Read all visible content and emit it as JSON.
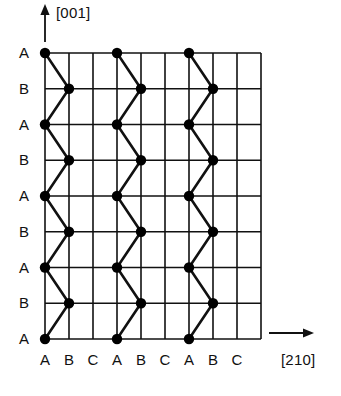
{
  "figure": {
    "type": "crystal-lattice-stacking-diagram",
    "background_color": "#ffffff",
    "line_color": "#111111",
    "node_color": "#000000",
    "axes": {
      "vertical": {
        "label": "[001]",
        "direction": "up",
        "arrow": "arrow-up-icon"
      },
      "horizontal": {
        "label": "[210]",
        "direction": "right",
        "arrow": "arrow-right-icon"
      }
    },
    "grid": {
      "x0": 45,
      "y0": 53,
      "cell_w": 24,
      "cell_h": 35.75,
      "cols": 9,
      "rows": 8,
      "x1": 261,
      "y1": 339,
      "stroke_width": 1.6
    },
    "row_labels": [
      "A",
      "B",
      "A",
      "B",
      "A",
      "B",
      "A",
      "B",
      "A"
    ],
    "col_labels": [
      "A",
      "B",
      "C",
      "A",
      "B",
      "C",
      "A",
      "B",
      "C"
    ],
    "nodes": [
      {
        "col": 0,
        "row": 0
      },
      {
        "col": 3,
        "row": 0
      },
      {
        "col": 6,
        "row": 0
      },
      {
        "col": 1,
        "row": 1
      },
      {
        "col": 4,
        "row": 1
      },
      {
        "col": 7,
        "row": 1
      },
      {
        "col": 0,
        "row": 2
      },
      {
        "col": 3,
        "row": 2
      },
      {
        "col": 6,
        "row": 2
      },
      {
        "col": 1,
        "row": 3
      },
      {
        "col": 4,
        "row": 3
      },
      {
        "col": 7,
        "row": 3
      },
      {
        "col": 0,
        "row": 4
      },
      {
        "col": 3,
        "row": 4
      },
      {
        "col": 6,
        "row": 4
      },
      {
        "col": 1,
        "row": 5
      },
      {
        "col": 4,
        "row": 5
      },
      {
        "col": 7,
        "row": 5
      },
      {
        "col": 0,
        "row": 6
      },
      {
        "col": 3,
        "row": 6
      },
      {
        "col": 6,
        "row": 6
      },
      {
        "col": 1,
        "row": 7
      },
      {
        "col": 4,
        "row": 7
      },
      {
        "col": 7,
        "row": 7
      },
      {
        "col": 0,
        "row": 8
      },
      {
        "col": 3,
        "row": 8
      },
      {
        "col": 6,
        "row": 8
      }
    ],
    "node_radius": 5.2,
    "chains": [
      {
        "name": "zigzag-chain-1",
        "start_col": 0,
        "alt_col": 1
      },
      {
        "name": "zigzag-chain-2",
        "start_col": 3,
        "alt_col": 4
      },
      {
        "name": "zigzag-chain-3",
        "start_col": 6,
        "alt_col": 7
      }
    ],
    "chain_stroke_width": 2.6
  },
  "chart_data": {
    "type": "scatter",
    "title": "",
    "xlabel": "[210]",
    "ylabel": "[001]",
    "x": [
      0,
      1,
      2,
      3,
      4,
      5,
      6,
      7,
      8
    ],
    "xticklabels": [
      "A",
      "B",
      "C",
      "A",
      "B",
      "C",
      "A",
      "B",
      "C"
    ],
    "yticklabels": [
      "A",
      "B",
      "A",
      "B",
      "A",
      "B",
      "A",
      "B",
      "A"
    ],
    "grid": true,
    "legend": "none",
    "series": [
      {
        "name": "zigzag-chain-1",
        "points": [
          [
            0,
            8
          ],
          [
            1,
            7
          ],
          [
            0,
            6
          ],
          [
            1,
            5
          ],
          [
            0,
            4
          ],
          [
            1,
            3
          ],
          [
            0,
            2
          ],
          [
            1,
            1
          ],
          [
            0,
            0
          ]
        ]
      },
      {
        "name": "zigzag-chain-2",
        "points": [
          [
            3,
            8
          ],
          [
            4,
            7
          ],
          [
            3,
            6
          ],
          [
            4,
            5
          ],
          [
            3,
            4
          ],
          [
            4,
            3
          ],
          [
            3,
            2
          ],
          [
            4,
            1
          ],
          [
            3,
            0
          ]
        ]
      },
      {
        "name": "zigzag-chain-3",
        "points": [
          [
            6,
            8
          ],
          [
            7,
            7
          ],
          [
            6,
            6
          ],
          [
            7,
            5
          ],
          [
            6,
            4
          ],
          [
            7,
            3
          ],
          [
            6,
            2
          ],
          [
            7,
            1
          ],
          [
            6,
            0
          ]
        ]
      }
    ],
    "xlim": [
      0,
      9
    ],
    "ylim": [
      0,
      8
    ]
  }
}
